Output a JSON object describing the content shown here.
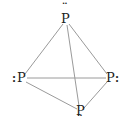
{
  "diagram": {
    "molecule": "P4",
    "geometry": "tetrahedral",
    "line_color": "#9a9a9a",
    "text_color": "#222222",
    "atoms": [
      {
        "id": "top",
        "symbol": "P",
        "lone_pair": "¨",
        "lone_pair_position": "above",
        "x": 66,
        "y": 19
      },
      {
        "id": "left",
        "symbol": "P",
        "lone_pair": ":",
        "lone_pair_position": "left",
        "x": 22,
        "y": 78
      },
      {
        "id": "right",
        "symbol": "P",
        "lone_pair": ":",
        "lone_pair_position": "right",
        "x": 110,
        "y": 78
      },
      {
        "id": "bottom",
        "symbol": "P",
        "lone_pair": "¨",
        "lone_pair_position": "below",
        "x": 80,
        "y": 111
      }
    ],
    "bonds": [
      [
        "top",
        "left"
      ],
      [
        "top",
        "right"
      ],
      [
        "top",
        "bottom"
      ],
      [
        "left",
        "right"
      ],
      [
        "left",
        "bottom"
      ],
      [
        "right",
        "bottom"
      ]
    ]
  }
}
